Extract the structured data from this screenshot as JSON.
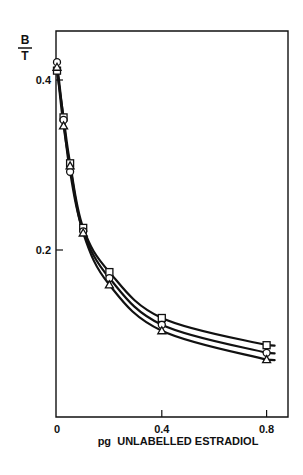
{
  "chart_data": {
    "type": "line",
    "title": "",
    "xlabel": "pg  UNLABELLED ESTRADIOL",
    "ylabel_top": "B",
    "ylabel_bottom": "T",
    "xlim": [
      0,
      0.85
    ],
    "ylim": [
      0.0,
      0.44
    ],
    "x_ticks": [
      0,
      0.4,
      0.8
    ],
    "x_tick_labels": [
      "0",
      "0.4",
      "0.8"
    ],
    "y_ticks": [
      0.2,
      0.4
    ],
    "y_tick_labels": [
      "0.2",
      "0.4"
    ],
    "grid": false,
    "legend": null,
    "x": [
      0,
      0.025,
      0.05,
      0.1,
      0.2,
      0.4,
      0.8
    ],
    "series": [
      {
        "name": "square",
        "marker": "square",
        "values": [
          0.411,
          0.356,
          0.302,
          0.226,
          0.174,
          0.12,
          0.088
        ]
      },
      {
        "name": "circle",
        "marker": "circle",
        "values": [
          0.421,
          0.353,
          0.292,
          0.222,
          0.167,
          0.112,
          0.079
        ]
      },
      {
        "name": "triangle",
        "marker": "triangle",
        "values": [
          0.415,
          0.346,
          0.299,
          0.22,
          0.159,
          0.105,
          0.071
        ]
      }
    ]
  },
  "colors": {
    "ink": "#111111",
    "background": "#ffffff"
  }
}
